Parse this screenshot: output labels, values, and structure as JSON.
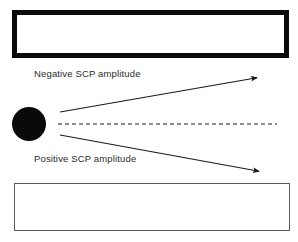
{
  "figure": {
    "background_color": "#ffffff",
    "width": 298,
    "height": 242
  },
  "labels": {
    "negative": "Negative SCP amplitude",
    "positive": "Positive SCP amplitude",
    "text_color": "#2b2b2b"
  },
  "shapes": {
    "top_rect": {
      "name": "top-electrode-bar",
      "stroke_color": "#0a0a0a",
      "fill_color": "#ffffff",
      "stroke_width": 5,
      "x": 12,
      "y": 10,
      "width": 267,
      "height": 38
    },
    "bottom_rect": {
      "name": "bottom-electrode-bar",
      "stroke_color": "#5a5a5a",
      "fill_color": "#ffffff",
      "stroke_width": 1,
      "x": 14,
      "y": 183,
      "width": 274,
      "height": 46
    },
    "source_dot": {
      "name": "source-dipole-dot",
      "fill_color": "#0a0a0a",
      "cx": 29,
      "cy": 124,
      "r": 17
    }
  },
  "vectors": {
    "stroke_color": "#1a1a1a",
    "baseline": {
      "name": "baseline-dashed",
      "x1": 58,
      "y1": 124,
      "x2": 277,
      "y2": 124,
      "dash": "4 3",
      "stroke_width": 1.1
    },
    "up_arrow": {
      "name": "negative-amplitude-arrow",
      "x1": 60,
      "y1": 112,
      "x2": 261,
      "y2": 77,
      "stroke_width": 1.1
    },
    "down_arrow": {
      "name": "positive-amplitude-arrow",
      "x1": 60,
      "y1": 135,
      "x2": 263,
      "y2": 172,
      "stroke_width": 1.1
    }
  }
}
